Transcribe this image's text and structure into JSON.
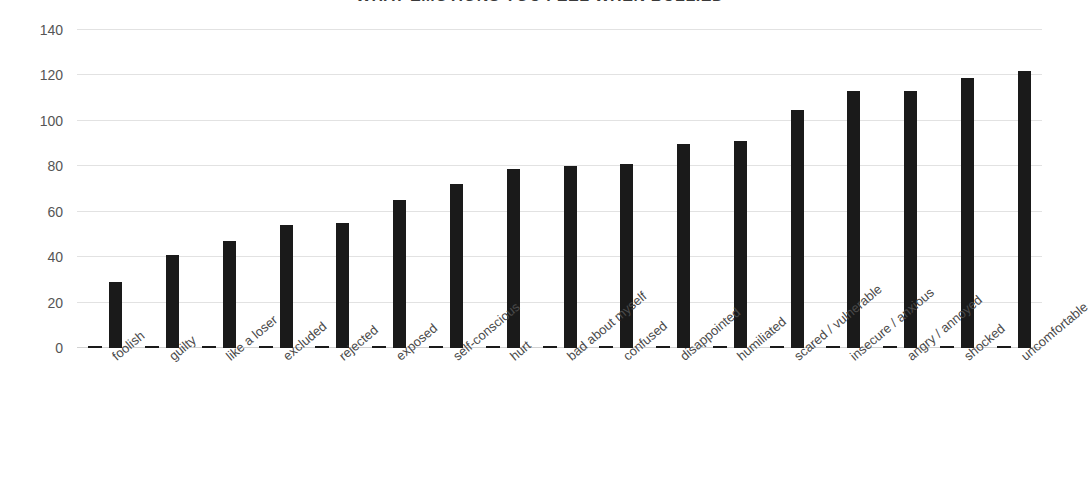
{
  "chart_data": {
    "type": "bar",
    "title": "WHAT EMOTIONS YOU FEEL WHEN BULLIED",
    "xlabel": "",
    "ylabel": "",
    "ylim": [
      0,
      140
    ],
    "yticks": [
      140,
      120,
      100,
      80,
      60,
      40,
      20,
      0
    ],
    "grid": true,
    "legend": "none",
    "bar_color": "#1a1a1a",
    "categories": [
      "foolish",
      "guilty",
      "like a loser",
      "excluded",
      "rejected",
      "exposed",
      "self-conscious",
      "hurt",
      "bad about myself",
      "confused",
      "disappointed",
      "humiliated",
      "scared / vulnerable",
      "insecure / anxious",
      "angry / annoyed",
      "shocked",
      "uncomfortable"
    ],
    "series": [
      {
        "name": "marker",
        "values": [
          1,
          1,
          1,
          1,
          1,
          1,
          1,
          1,
          1,
          1,
          1,
          1,
          1,
          1,
          1,
          1,
          1
        ]
      },
      {
        "name": "count",
        "values": [
          29,
          41,
          47,
          54,
          55,
          65,
          72,
          79,
          80,
          81,
          90,
          91,
          105,
          113,
          113,
          119,
          122
        ]
      }
    ]
  }
}
